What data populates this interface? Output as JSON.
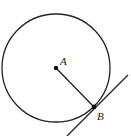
{
  "diagram": {
    "type": "circle-tangent",
    "circle": {
      "cx": 56,
      "cy": 68,
      "r": 54,
      "stroke": "#222222"
    },
    "points": [
      {
        "id": "A",
        "label": "A",
        "x": 56,
        "y": 68,
        "label_x": 61,
        "label_y": 65
      },
      {
        "id": "B",
        "label": "B",
        "x": 94,
        "y": 107,
        "label_x": 97,
        "label_y": 120
      }
    ],
    "radius_segment": {
      "from": "A",
      "to": "B"
    },
    "tangent_line": {
      "x1": 67,
      "y1": 136,
      "x2": 128,
      "y2": 75,
      "through": "B"
    },
    "labels": {
      "A": "A",
      "B": "B"
    }
  }
}
